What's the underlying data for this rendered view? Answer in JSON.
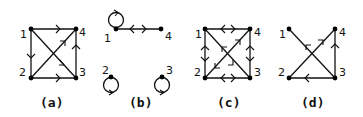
{
  "figure": {
    "panels": [
      {
        "caption": "(a)",
        "nodes": [
          {
            "id": "1",
            "label": "1"
          },
          {
            "id": "2",
            "label": "2"
          },
          {
            "id": "3",
            "label": "3"
          },
          {
            "id": "4",
            "label": "4"
          }
        ],
        "edges": [
          {
            "from": "1",
            "to": "4",
            "type": "directed"
          },
          {
            "from": "1",
            "to": "2",
            "type": "directed"
          },
          {
            "from": "2",
            "to": "3",
            "type": "directed"
          },
          {
            "from": "3",
            "to": "4",
            "type": "directed"
          },
          {
            "from": "1",
            "to": "3",
            "type": "directed"
          },
          {
            "from": "2",
            "to": "4",
            "type": "directed"
          }
        ]
      },
      {
        "caption": "(b)",
        "nodes": [
          {
            "id": "1",
            "label": "1"
          },
          {
            "id": "2",
            "label": "2"
          },
          {
            "id": "3",
            "label": "3"
          },
          {
            "id": "4",
            "label": "4"
          }
        ],
        "edges": [
          {
            "from": "1",
            "to": "1",
            "type": "self-loop"
          },
          {
            "from": "1",
            "to": "4",
            "type": "bidirectional"
          },
          {
            "from": "2",
            "to": "2",
            "type": "self-loop"
          },
          {
            "from": "3",
            "to": "3",
            "type": "self-loop"
          }
        ]
      },
      {
        "caption": "(c)",
        "nodes": [
          {
            "id": "1",
            "label": "1"
          },
          {
            "id": "2",
            "label": "2"
          },
          {
            "id": "3",
            "label": "3"
          },
          {
            "id": "4",
            "label": "4"
          }
        ],
        "edges": [
          {
            "from": "1",
            "to": "4",
            "type": "bidirectional"
          },
          {
            "from": "1",
            "to": "2",
            "type": "bidirectional"
          },
          {
            "from": "2",
            "to": "3",
            "type": "bidirectional"
          },
          {
            "from": "3",
            "to": "4",
            "type": "bidirectional"
          },
          {
            "from": "1",
            "to": "3",
            "type": "bidirectional"
          },
          {
            "from": "2",
            "to": "4",
            "type": "bidirectional"
          }
        ]
      },
      {
        "caption": "(d)",
        "nodes": [
          {
            "id": "1",
            "label": "1"
          },
          {
            "id": "2",
            "label": "2"
          },
          {
            "id": "3",
            "label": "3"
          },
          {
            "id": "4",
            "label": "4"
          }
        ],
        "edges": [
          {
            "from": "3",
            "to": "1",
            "type": "directed"
          },
          {
            "from": "2",
            "to": "4",
            "type": "directed"
          },
          {
            "from": "3",
            "to": "2",
            "type": "directed"
          },
          {
            "from": "3",
            "to": "4",
            "type": "directed"
          }
        ]
      }
    ]
  }
}
